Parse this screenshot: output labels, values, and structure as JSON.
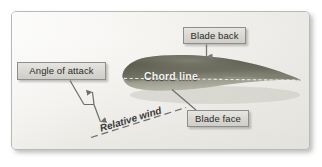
{
  "figure": {
    "background_color": "#f2f1ee",
    "frame_border_color": "#b9b9b7"
  },
  "callouts": [
    {
      "id": "angle-of-attack",
      "label": "Angle of attack",
      "box_fill": "#ddddd8",
      "box_border": "#8e8e8a"
    },
    {
      "id": "blade-back",
      "label": "Blade back",
      "box_fill": "#ddddd8",
      "box_border": "#8e8e8a"
    },
    {
      "id": "blade-face",
      "label": "Blade face",
      "box_fill": "#ddddd8",
      "box_border": "#8e8e8a"
    }
  ],
  "annotations": {
    "chord_line": "Chord line",
    "chord_line_color": "#f4f3ef",
    "relative_wind": "Relative wind",
    "relative_wind_color": "#3a3a38"
  },
  "shapes": {
    "airfoil_name": "airfoil-blade-section",
    "airfoil_fill_dark": "#4e4f42",
    "airfoil_fill_light": "#8d8e7e",
    "leader_line_color": "#6e6e6a"
  }
}
